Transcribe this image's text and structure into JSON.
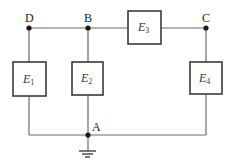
{
  "diagram": {
    "type": "circuit",
    "nodes": [
      {
        "id": "D",
        "label": "D"
      },
      {
        "id": "B",
        "label": "B"
      },
      {
        "id": "C",
        "label": "C"
      },
      {
        "id": "A",
        "label": "A"
      }
    ],
    "elements": [
      {
        "id": "E1",
        "label": "E",
        "subscript": "1",
        "between": [
          "D",
          "A"
        ]
      },
      {
        "id": "E2",
        "label": "E",
        "subscript": "2",
        "between": [
          "B",
          "A"
        ]
      },
      {
        "id": "E3",
        "label": "E",
        "subscript": "3",
        "between": [
          "B",
          "C"
        ]
      },
      {
        "id": "E4",
        "label": "E",
        "subscript": "4",
        "between": [
          "C",
          "A"
        ]
      }
    ],
    "ground": {
      "node": "A",
      "symbol": "ground-icon"
    }
  }
}
